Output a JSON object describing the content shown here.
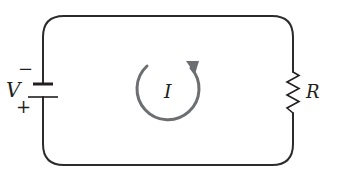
{
  "diagram": {
    "type": "circuit",
    "colors": {
      "wire": "#2b2b2b",
      "current_arrow": "#6d6e71",
      "text": "#231f20",
      "background": "#ffffff"
    },
    "battery": {
      "label": "V",
      "negative_sign": "−",
      "positive_sign": "+"
    },
    "resistor": {
      "label": "R"
    },
    "current": {
      "label": "I",
      "direction": "counterclockwise"
    }
  }
}
